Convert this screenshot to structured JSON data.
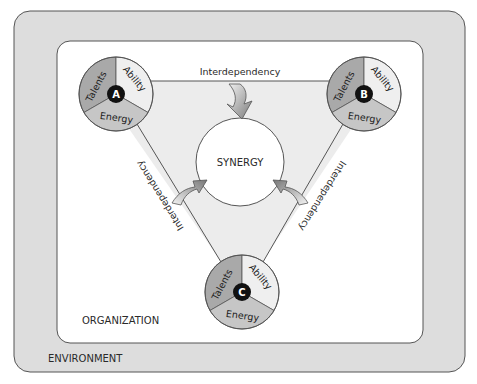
{
  "environment": {
    "label": "ENVIRONMENT"
  },
  "organization": {
    "label": "ORGANIZATION"
  },
  "center": {
    "label": "SYNERGY"
  },
  "members": [
    {
      "id": "A",
      "segments": {
        "talents": "Talents",
        "ability": "Ability",
        "energy": "Energy"
      }
    },
    {
      "id": "B",
      "segments": {
        "talents": "Talents",
        "ability": "Ability",
        "energy": "Energy"
      }
    },
    {
      "id": "C",
      "segments": {
        "talents": "Talents",
        "ability": "Ability",
        "energy": "Energy"
      }
    }
  ],
  "links": {
    "top": "Interdependency",
    "left": "Interdependency",
    "right": "Interdependency"
  },
  "colors": {
    "environment_fill": "#dddddd",
    "organization_fill": "#ffffff",
    "triangle_fill": "#ececec",
    "talents_fill": "#a9a9a9",
    "ability_fill": "#efefef",
    "energy_fill": "#c6c6c6",
    "badge_fill": "#111111",
    "stroke": "#555555"
  }
}
